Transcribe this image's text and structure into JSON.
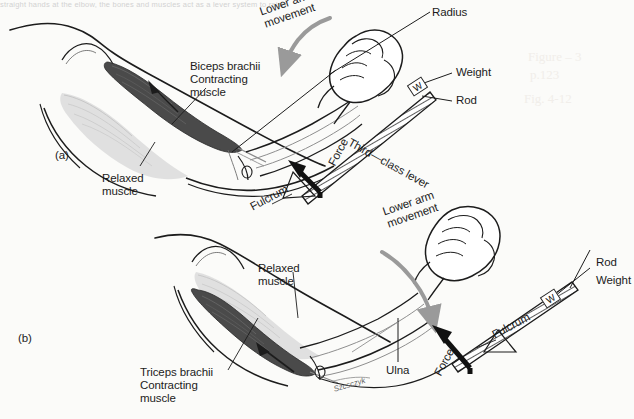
{
  "figure": {
    "title_strip": "straight hands at the elbow, the bones and muscles act as a lever system to raise",
    "background": "#fbfbf9",
    "ink_color": "#1c1c1c",
    "contracting_muscle_color": "#4a4a4a",
    "relaxed_muscle_color": "#d9d9d9",
    "movement_arrow_color": "#9a9a9a",
    "force_arrow_color": "#111111"
  },
  "panels": [
    {
      "id": "(a)",
      "description": "Flexion: biceps brachii contracting, triceps relaxed, third-class lever",
      "labels": {
        "panel_id": "(a)",
        "lower_arm_movement": "Lower arm\nmovement",
        "biceps": "Biceps brachii\nContracting\nmuscle",
        "relaxed": "Relaxed\nmuscle",
        "radius": "Radius",
        "weight": "Weight",
        "rod": "Rod",
        "force": "Force",
        "fulcrum": "Fulcrum",
        "lever_class": "Third—class lever",
        "weight_box": "W"
      }
    },
    {
      "id": "(b)",
      "description": "Extension: triceps brachii contracting, biceps relaxed, first-class lever",
      "labels": {
        "panel_id": "(b)",
        "lower_arm_movement": "Lower arm\nmovement",
        "triceps": "Triceps brachii\nContracting\nmuscle",
        "relaxed": "Relaxed\nmuscle",
        "ulna": "Ulna",
        "weight": "Weight",
        "rod": "Rod",
        "force": "Force",
        "fulcrum": "Fulcrum",
        "weight_box": "W"
      }
    }
  ],
  "artist_signature": "Szcsczyk",
  "pencil_annotation": {
    "line1": "Figure – 3",
    "line2": "p.123",
    "line3": "Fig. 4-12"
  }
}
